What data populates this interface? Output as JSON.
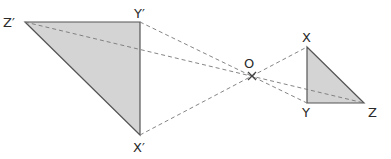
{
  "diagram": {
    "type": "enlargement-negative-scale-factor",
    "centre": {
      "label": "O",
      "x": 252,
      "y": 76
    },
    "object_triangle": {
      "vertices": {
        "X": {
          "label": "X",
          "x": 307,
          "y": 47
        },
        "Y": {
          "label": "Y",
          "x": 307,
          "y": 103
        },
        "Z": {
          "label": "Z",
          "x": 364,
          "y": 103
        }
      }
    },
    "image_triangle": {
      "vertices": {
        "X'": {
          "label": "X′",
          "x": 140,
          "y": 135
        },
        "Y'": {
          "label": "Y′",
          "x": 140,
          "y": 22
        },
        "Z'": {
          "label": "Z′",
          "x": 25,
          "y": 22
        }
      }
    },
    "colors": {
      "fill": "#d4d4d4",
      "stroke": "#555555",
      "dashed": "#777777",
      "text": "#2a2a2a"
    }
  },
  "labels": {
    "z_prime": "Z′",
    "y_prime": "Y′",
    "x_prime": "X′",
    "o": "O",
    "x": "X",
    "y": "Y",
    "z": "Z"
  }
}
